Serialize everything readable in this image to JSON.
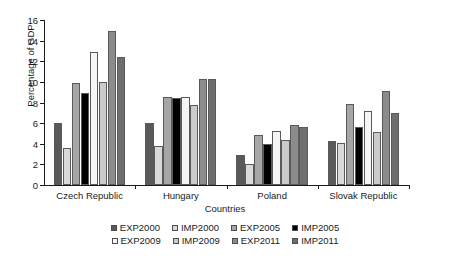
{
  "chart_data": {
    "type": "bar",
    "title": "",
    "xlabel": "Countries",
    "ylabel": "Percentage of GDP",
    "ylim": [
      0,
      16
    ],
    "yticks": [
      "0",
      "2",
      "4",
      "6",
      "8",
      "10",
      "12",
      "14",
      "16"
    ],
    "grid": false,
    "legend_position": "bottom",
    "categories": [
      "Czech Republic",
      "Hungary",
      "Poland",
      "Slovak Republic"
    ],
    "series": [
      {
        "name": "EXP2000",
        "color": "#595959",
        "values": [
          6.0,
          6.0,
          2.9,
          4.25
        ]
      },
      {
        "name": "IMP2000",
        "color": "#d9d9d9",
        "values": [
          3.6,
          3.8,
          2.05,
          4.05
        ]
      },
      {
        "name": "EXP2005",
        "color": "#a6a6a6",
        "values": [
          9.85,
          8.55,
          4.85,
          7.9
        ]
      },
      {
        "name": "IMP2005",
        "color": "#000000",
        "values": [
          8.9,
          8.4,
          4.0,
          5.65
        ]
      },
      {
        "name": "EXP2009",
        "color": "#f5f5f5",
        "values": [
          12.9,
          8.5,
          5.2,
          7.2
        ]
      },
      {
        "name": "IMP2009",
        "color": "#cbcbcb",
        "values": [
          9.95,
          7.75,
          4.4,
          5.15
        ]
      },
      {
        "name": "EXP2011",
        "color": "#8c8c8c",
        "values": [
          14.9,
          10.3,
          5.85,
          9.1
        ]
      },
      {
        "name": "IMP2011",
        "color": "#6e6e6e",
        "values": [
          12.45,
          10.25,
          5.6,
          6.95
        ]
      }
    ]
  }
}
